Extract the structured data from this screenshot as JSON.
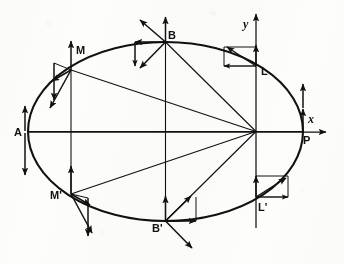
{
  "figure": {
    "background_color": "#fdfdfc",
    "stroke_color": "#111111",
    "axes": {
      "x_label": "x",
      "y_label": "y",
      "x_axis_y": 132,
      "y_axis_x": 256
    },
    "ellipse": {
      "center_x": 165.5,
      "center_y": 131.5,
      "semi_major": 137.5,
      "semi_minor": 89.5,
      "focus_x": 256,
      "focus_y": 131.5
    },
    "points": [
      {
        "id": "A",
        "label": "A",
        "x": 28,
        "y": 131.5,
        "label_dx": -12,
        "label_dy": 4
      },
      {
        "id": "M",
        "label": "M",
        "x": 71,
        "y": 70,
        "label_dx": 8,
        "label_dy": -9
      },
      {
        "id": "B",
        "label": "B",
        "x": 165.5,
        "y": 42,
        "label_dx": 5,
        "label_dy": -3
      },
      {
        "id": "L",
        "label": "L",
        "x": 256,
        "y": 66,
        "label_dx": 6,
        "label_dy": 8
      },
      {
        "id": "P",
        "label": "P",
        "x": 303,
        "y": 131.5,
        "label_dx": 4,
        "label_dy": 12
      },
      {
        "id": "Lp",
        "label": "L'",
        "x": 256,
        "y": 197,
        "label_dx": 4,
        "label_dy": 13
      },
      {
        "id": "Bp",
        "label": "B'",
        "x": 165.5,
        "y": 221,
        "label_dx": -12,
        "label_dy": 9
      },
      {
        "id": "Mp",
        "label": "M'",
        "x": 71,
        "y": 194,
        "label_dx": -18,
        "label_dy": 4
      }
    ],
    "radius_lines": [
      {
        "from": "focus",
        "to": "A"
      },
      {
        "from": "focus",
        "to": "M"
      },
      {
        "from": "focus",
        "to": "B"
      },
      {
        "from": "focus",
        "to": "Mp"
      },
      {
        "from": "focus",
        "to": "Bp"
      },
      {
        "from": "focus",
        "to": "P"
      }
    ],
    "vertical_chords": [
      {
        "x": 71,
        "y_top": 70,
        "y_bottom": 194
      },
      {
        "x": 165.5,
        "y_top": 42,
        "y_bottom": 221
      },
      {
        "x": 256,
        "y_top": 24,
        "y_bottom": 215
      }
    ],
    "vector_groups": [
      {
        "point": "A",
        "description": "tangential velocity up and resultant down"
      },
      {
        "point": "M",
        "description": "velocity components at M"
      },
      {
        "point": "B",
        "description": "velocity components at B (minor axis top)"
      },
      {
        "point": "L",
        "description": "velocity components at L (latus rectum top)"
      },
      {
        "point": "P",
        "description": "tangential velocity up at P"
      },
      {
        "point": "Lp",
        "description": "velocity components at L' (latus rectum bottom)"
      },
      {
        "point": "Bp",
        "description": "velocity components at B' (minor axis bottom)"
      },
      {
        "point": "Mp",
        "description": "velocity components at M'"
      }
    ]
  }
}
